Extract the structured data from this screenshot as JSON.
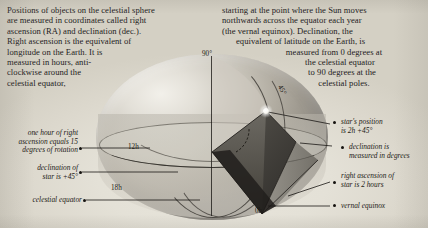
{
  "paragraphs": {
    "left": "Positions of objects on the celestial sphere are measured in coordinates called right ascension (RA) and declination (dec.). Right ascension is the equivalent of longitude on the Earth. It is measured in hours, anti-clockwise around the celestial equator,",
    "left_lines": [
      "Positions of objects on the celestial sphere",
      "are measured in coordinates called right",
      "ascension (RA) and declination (dec.).",
      "Right ascension is the equivalent of",
      "longitude on the Earth. It is",
      "measured in hours, anti-",
      "clockwise around the",
      "celestial equator,"
    ],
    "right_lines": [
      "starting at the point where the Sun moves",
      "northwards across the equator each year",
      "(the vernal equinox). Declination, the",
      "equivalent of latitude on the Earth, is",
      "measured from 0 degrees at",
      "the celestial equator",
      "to 90 degrees at the",
      "celestial poles."
    ]
  },
  "diagram": {
    "ticks": [
      {
        "id": "pole-90",
        "label": "90°"
      },
      {
        "id": "parallel-45",
        "label": "45°"
      },
      {
        "id": "hour-12",
        "label": "12h"
      },
      {
        "id": "hour-18",
        "label": "18h"
      },
      {
        "id": "hour-0-left",
        "label": "0h"
      },
      {
        "id": "hour-0-bottom",
        "label": "0h"
      }
    ],
    "callouts": {
      "one_hour": [
        "one hour of right",
        "ascension equals 15",
        "degrees of rotation"
      ],
      "declination_star": [
        "declination of",
        "star is +45°"
      ],
      "celestial_equator": [
        "celestial equator"
      ],
      "star_position": [
        "star's position",
        "is 2h +45°"
      ],
      "declination_degrees": [
        "declination is",
        "measured in degrees"
      ],
      "right_ascension_star": [
        "right ascension of",
        "star is 2 hours"
      ],
      "vernal_equinox": [
        "vernal equinox"
      ]
    }
  },
  "colors": {
    "page_background": "#ddd9d0",
    "sphere_light": "#f2f0ea",
    "sphere_dark": "#949089",
    "wedge_dark": "#3c3a36",
    "wedge_mid": "#6e6b64",
    "ink": "#1d1a16"
  }
}
